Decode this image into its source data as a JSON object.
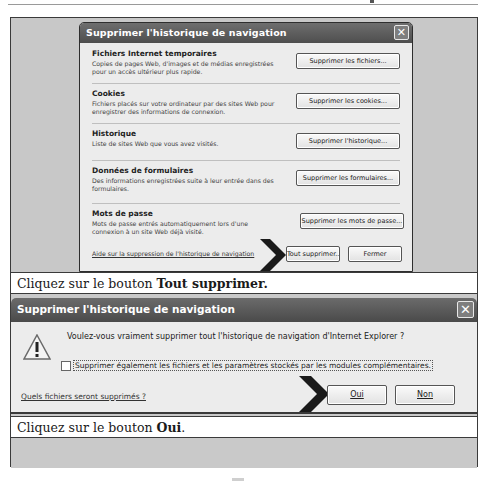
{
  "dialog1": {
    "title": "Supprimer l'historique de navigation",
    "close_glyph": "✕",
    "sections": [
      {
        "heading": "Fichiers Internet temporaires",
        "description": "Copies de pages Web, d'images et de médias enregistrées pour un accès ultérieur plus rapide.",
        "button": "Supprimer les fichiers..."
      },
      {
        "heading": "Cookies",
        "description": "Fichiers placés sur votre ordinateur par des sites Web pour enregistrer des informations de connexion.",
        "button": "Supprimer les cookies..."
      },
      {
        "heading": "Historique",
        "description": "Liste de sites Web que vous avez visités.",
        "button": "Supprimer l'historique..."
      },
      {
        "heading": "Données de formulaires",
        "description": "Des informations enregistrées suite à leur entrée dans des formulaires.",
        "button": "Supprimer les formulaires..."
      },
      {
        "heading": "Mots de passe",
        "description": "Mots de passe entrés automatiquement lors d'une connexion à un site Web déjà visité.",
        "button": "Supprimer les mots de passe..."
      }
    ],
    "help_link": "Aide sur la suppression de l'historique de navigation",
    "delete_all_button": "Tout supprimer...",
    "close_button": "Fermer"
  },
  "caption1": {
    "prefix": "Cliquez sur le bouton ",
    "bold": "Tout supprimer.",
    "suffix": ""
  },
  "dialog2": {
    "title": "Supprimer l'historique de navigation",
    "close_glyph": "✕",
    "warning_icon": "warning-triangle-icon",
    "warning_glyph": "!",
    "question": "Voulez-vous vraiment supprimer tout l'historique de navigation d'Internet Explorer ?",
    "checkbox_label": "Supprimer également les fichiers et les paramètres stockés par les modules complémentaires.",
    "checkbox_checked": false,
    "link": "Quels fichiers seront supprimés ?",
    "yes_button": "Oui",
    "no_button": "Non"
  },
  "caption2": {
    "prefix": "Cliquez sur le bouton ",
    "bold": "Oui",
    "suffix": "."
  },
  "colors": {
    "titlebar": "#5a5a5a",
    "panel_bg": "#c8c8c8",
    "dialog_bg": "#ececec",
    "arrow": "#1a1a1a"
  }
}
